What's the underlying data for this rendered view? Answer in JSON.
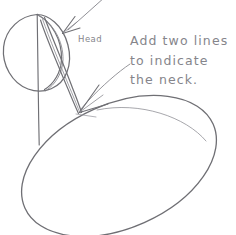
{
  "document": {
    "kind": "hand-drawn pencil sketch",
    "title": "Figure drawing construction step — head, neck and torso"
  },
  "canvas": {
    "width": 236,
    "height": 235,
    "background_color": "#ffffff"
  },
  "ink": {
    "primary_color": "#6f6f74",
    "soft_color": "#8a8a90",
    "faint_color": "#a0a0a6",
    "text_color": "#85858b"
  },
  "labels": {
    "head": "Head"
  },
  "annotation": {
    "lines": [
      "Add two lines",
      "to indicate",
      "the neck."
    ],
    "full_text": "Add two lines to indicate the neck."
  },
  "shapes": [
    {
      "name": "head-circle",
      "type": "circle",
      "cx": 36,
      "cy": 52,
      "r": 33
    },
    {
      "name": "head-center-vertical-line",
      "type": "line",
      "x1": 37,
      "y1": 14,
      "x2": 39,
      "y2": 145
    },
    {
      "name": "head-side-arc",
      "type": "arc",
      "from": [
        37,
        14
      ],
      "to": [
        45,
        90
      ]
    },
    {
      "name": "neck-line-outer",
      "type": "line",
      "from": [
        45,
        18
      ],
      "to": [
        83,
        112
      ]
    },
    {
      "name": "neck-line-inner",
      "type": "line",
      "from": [
        40,
        20
      ],
      "to": [
        80,
        113
      ]
    },
    {
      "name": "body-ellipse",
      "type": "ellipse",
      "cx": 119,
      "cy": 166,
      "rx": 103,
      "ry": 62,
      "rotation_deg": -24
    }
  ],
  "arrows": [
    {
      "name": "arrow-to-head",
      "points_to": "head-circle",
      "tail": [
        104,
        0
      ],
      "tip": [
        62,
        33
      ],
      "direction": "down-left"
    },
    {
      "name": "arrow-to-neck",
      "points_to": "neck-lines",
      "tail": [
        128,
        66
      ],
      "tip": [
        80,
        112
      ],
      "direction": "down-left"
    }
  ]
}
